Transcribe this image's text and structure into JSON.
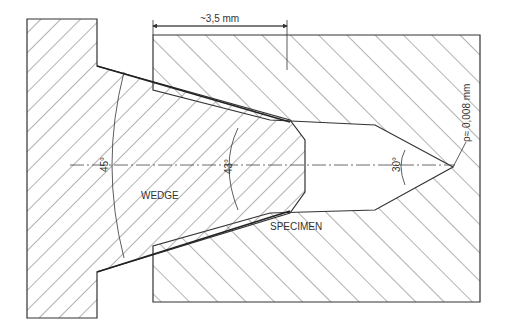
{
  "figure": {
    "type": "technical-cross-section",
    "parts": {
      "wedge": "WEDGE",
      "specimen": "SPECIMEN"
    },
    "dimensions": {
      "width_label": "~3,5 mm",
      "tip_radius_label": "ρ≈ 0,008 mm"
    },
    "angles": {
      "outer": "45°",
      "wedge": "43°",
      "notch": "30°"
    }
  },
  "colors": {
    "line": "#333333",
    "hatch": "#555555",
    "background": "#ffffff"
  }
}
